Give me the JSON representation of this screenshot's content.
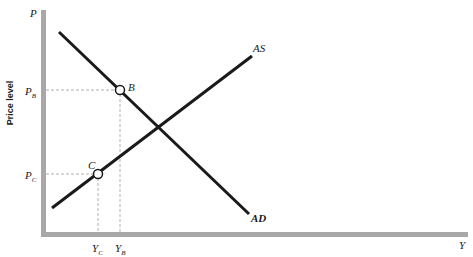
{
  "diagram": {
    "title": "",
    "axes": {
      "y_axis_letter": "P",
      "y_axis_title": "Price level",
      "x_axis_letter": "Y",
      "axis_color": "#a8a8a8"
    },
    "curves": [
      {
        "id": "AD",
        "label": "AD",
        "from": [
          59,
          32
        ],
        "to": [
          249,
          214
        ],
        "color": "#1a1a1a"
      },
      {
        "id": "AS",
        "label": "AS",
        "from": [
          52,
          208
        ],
        "to": [
          252,
          56
        ],
        "color": "#1a1a1a"
      }
    ],
    "points": [
      {
        "id": "B",
        "label": "B",
        "x": 120,
        "y": 90,
        "price_label": "P",
        "price_sub": "B",
        "output_label": "Y",
        "output_sub": "B"
      },
      {
        "id": "C",
        "label": "C",
        "x": 98,
        "y": 174,
        "price_label": "P",
        "price_sub": "C",
        "output_label": "Y",
        "output_sub": "C"
      }
    ],
    "guide_line_color": "#b0b0b0"
  }
}
